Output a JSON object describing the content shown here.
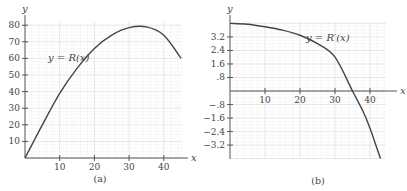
{
  "chart_data": [
    {
      "type": "line",
      "panel": "a",
      "caption": "(a)",
      "title": "",
      "curve_label": "y = R(x)",
      "xlabel": "x",
      "ylabel": "y",
      "xlim": [
        0,
        45
      ],
      "ylim": [
        0,
        80
      ],
      "xticks": [
        10,
        20,
        30,
        40
      ],
      "yticks": [
        10,
        20,
        30,
        40,
        50,
        60,
        70,
        80
      ],
      "grid": true,
      "series": [
        {
          "name": "R(x)",
          "x": [
            0,
            5,
            10,
            15,
            20,
            25,
            30,
            35,
            40,
            45
          ],
          "values": [
            0,
            20,
            39,
            54,
            66,
            74,
            78.5,
            79,
            74,
            60
          ]
        }
      ]
    },
    {
      "type": "line",
      "panel": "b",
      "caption": "(b)",
      "title": "",
      "curve_label": "y = R′(x)",
      "xlabel": "x",
      "ylabel": "y",
      "xlim": [
        0,
        45
      ],
      "ylim": [
        -4,
        4
      ],
      "xticks": [
        10,
        20,
        30,
        40
      ],
      "yticks": [
        3.2,
        2.4,
        1.6,
        0.8,
        -0.8,
        -1.6,
        -2.4,
        -3.2
      ],
      "ytick_labels": [
        "3.2",
        "2.4",
        "1.6",
        ".8",
        "−.8",
        "−1.6",
        "−2.4",
        "−3.2"
      ],
      "grid": true,
      "series": [
        {
          "name": "R'(x)",
          "x": [
            0,
            5,
            10,
            15,
            20,
            25,
            30,
            35,
            38,
            40,
            42,
            43
          ],
          "values": [
            4.0,
            3.95,
            3.8,
            3.6,
            3.3,
            2.8,
            2.0,
            0,
            -1.2,
            -2.2,
            -3.4,
            -4.0
          ]
        }
      ]
    }
  ]
}
